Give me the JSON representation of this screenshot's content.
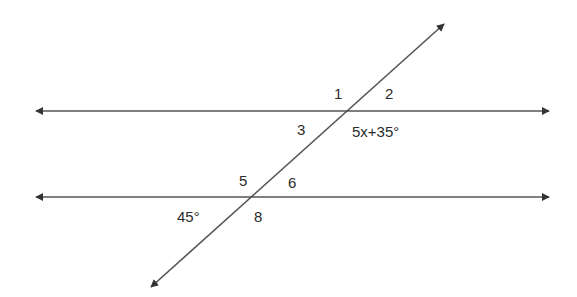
{
  "diagram": {
    "type": "parallel-lines-transversal",
    "line_color": "#444444",
    "text_color": "#2b2b2b",
    "lines": [
      {
        "name": "upper-parallel-line",
        "x1": 34,
        "y1": 111,
        "x2": 551,
        "y2": 111,
        "arrows": "both"
      },
      {
        "name": "lower-parallel-line",
        "x1": 34,
        "y1": 197,
        "x2": 551,
        "y2": 197,
        "arrows": "both"
      },
      {
        "name": "transversal-line",
        "x1": 149,
        "y1": 289,
        "x2": 446,
        "y2": 22,
        "arrows": "both"
      }
    ],
    "labels": {
      "angle1": "1",
      "angle2": "2",
      "angle3": "3",
      "angle4_expr": "5x+35°",
      "angle5": "5",
      "angle6": "6",
      "angle7_value": "45°",
      "angle8": "8"
    }
  }
}
